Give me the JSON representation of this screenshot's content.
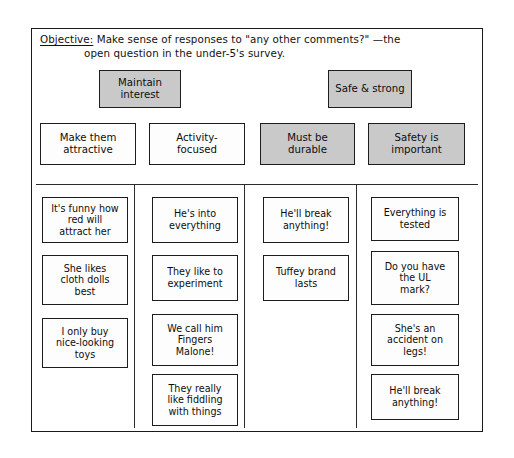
{
  "board": {
    "title": "affinity-diagram",
    "objective": {
      "label": "Objective:",
      "line1": " Make sense of responses to \"any other comments?\" —the",
      "line2": "open question in the under-5's survey."
    },
    "themes": [
      {
        "label": "Maintain\ninterest",
        "shaded": true
      },
      {
        "label": "Safe & strong",
        "shaded": true
      }
    ],
    "categories": [
      {
        "label": "Make them\nattractive",
        "shaded": false
      },
      {
        "label": "Activity-\nfocused",
        "shaded": false
      },
      {
        "label": "Must be\ndurable",
        "shaded": true
      },
      {
        "label": "Safety is\nimportant",
        "shaded": true
      }
    ],
    "columns": [
      {
        "name": "make-them-attractive",
        "notes": [
          "It's funny how\nred will\nattract her",
          "She likes\ncloth dolls\nbest",
          "I only buy\nnice-looking\ntoys"
        ]
      },
      {
        "name": "activity-focused",
        "notes": [
          "He's into\neverything",
          "They like to\nexperiment",
          "We call him\nFingers\nMalone!",
          "They really\nlike fiddling\nwith things"
        ]
      },
      {
        "name": "must-be-durable",
        "notes": [
          "He'll break\nanything!",
          "Tuffey brand\nlasts"
        ]
      },
      {
        "name": "safety-is-important",
        "notes": [
          "Everything is\ntested",
          "Do you have\nthe UL\nmark?",
          "She's an\naccident on\nlegs!",
          "He'll break\nanything!"
        ]
      }
    ],
    "colors": {
      "ink": "#1a1a1a",
      "shaded_fill": "#c9c9c9",
      "plain_fill": "#fdfdfd",
      "board_bg": "#ffffff"
    }
  }
}
